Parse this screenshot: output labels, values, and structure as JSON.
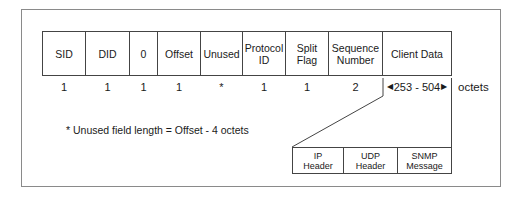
{
  "diagram": {
    "fields": [
      {
        "label": "SID",
        "length": "1"
      },
      {
        "label": "DID",
        "length": "1"
      },
      {
        "label": "0",
        "length": "1"
      },
      {
        "label": "Offset",
        "length": "1"
      },
      {
        "label": "Unused",
        "length": "*"
      },
      {
        "label": "Protocol ID",
        "length": "1"
      },
      {
        "label": "Split Flag",
        "length": "1"
      },
      {
        "label": "Sequence Number",
        "length": "2"
      },
      {
        "label": "Client Data",
        "length": "253 - 504"
      }
    ],
    "unit_label": "octets",
    "footnote": "* Unused field length = Offset - 4 octets",
    "client_data_breakdown": [
      {
        "label": "IP Header"
      },
      {
        "label": "UDP Header"
      },
      {
        "label": "SNMP Message"
      }
    ],
    "colors": {
      "line": "#444444",
      "frame": "#8a8a8a",
      "text": "#1a1a1a"
    }
  }
}
